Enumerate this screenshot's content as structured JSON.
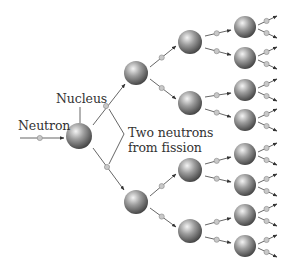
{
  "labels": {
    "neutron": "Neutron",
    "nucleus": "Nucleus",
    "two_neutrons_line1": "Two neutrons",
    "two_neutrons_line2": "from fission"
  },
  "colors": {
    "nucleus_light": "#f2f2f2",
    "nucleus_mid": "#9a9a9a",
    "nucleus_dark": "#4a4a4a",
    "neutron_fill": "#c8c8c8",
    "line": "#555555",
    "text": "#333333"
  },
  "generations": [
    {
      "level": 1,
      "nuclei": [
        {
          "x": 79,
          "y": 136,
          "r": 13
        }
      ]
    },
    {
      "level": 2,
      "nuclei": [
        {
          "x": 136,
          "y": 73,
          "r": 12
        },
        {
          "x": 136,
          "y": 202,
          "r": 12
        }
      ]
    },
    {
      "level": 3,
      "nuclei": [
        {
          "x": 190,
          "y": 42,
          "r": 12
        },
        {
          "x": 190,
          "y": 103,
          "r": 12
        },
        {
          "x": 190,
          "y": 170,
          "r": 12
        },
        {
          "x": 190,
          "y": 231,
          "r": 12
        }
      ]
    },
    {
      "level": 4,
      "nuclei": [
        {
          "x": 245,
          "y": 27,
          "r": 11
        },
        {
          "x": 245,
          "y": 58,
          "r": 11
        },
        {
          "x": 245,
          "y": 90,
          "r": 11
        },
        {
          "x": 245,
          "y": 120,
          "r": 11
        },
        {
          "x": 245,
          "y": 154,
          "r": 11
        },
        {
          "x": 245,
          "y": 185,
          "r": 11
        },
        {
          "x": 245,
          "y": 215,
          "r": 11
        },
        {
          "x": 245,
          "y": 246,
          "r": 11
        }
      ]
    }
  ]
}
